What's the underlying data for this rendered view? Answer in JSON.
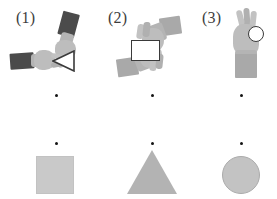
{
  "figure": {
    "background_color": "#ffffff",
    "width": 277,
    "height": 199,
    "columns": 3
  },
  "panels": [
    {
      "label": "(1)",
      "gesture_icon": "two-hands-triangle-gesture-icon",
      "gesture_shape": "triangle-outline",
      "sleeve_color": "#4b4b4b",
      "hand_color": "#bdbdbd",
      "result_shape": "square",
      "result_shape_icon": "square-shape-icon",
      "result_color": "#c9c9c9"
    },
    {
      "label": "(2)",
      "gesture_icon": "two-hands-rectangle-gesture-icon",
      "gesture_shape": "rectangle-outline",
      "sleeve_color": "#a9a9a9",
      "hand_color": "#bdbdbd",
      "result_shape": "triangle",
      "result_shape_icon": "triangle-shape-icon",
      "result_color": "#b3b3b3"
    },
    {
      "label": "(3)",
      "gesture_icon": "one-hand-ok-circle-gesture-icon",
      "gesture_shape": "circle-outline",
      "sleeve_color": "#a9a9a9",
      "hand_color": "#bdbdbd",
      "result_shape": "circle",
      "result_shape_icon": "circle-shape-icon",
      "result_color": "#c3c3c3"
    }
  ],
  "dot_rows": [
    {
      "name": "upper-dot-row",
      "y": 95,
      "color": "#141414",
      "count": 3
    },
    {
      "name": "lower-dot-row",
      "y": 143,
      "color": "#141414",
      "count": 3
    }
  ]
}
